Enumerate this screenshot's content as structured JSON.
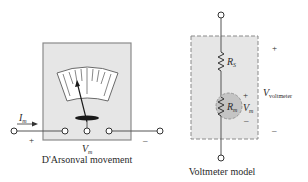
{
  "left_figure": {
    "caption": "D'Arsonval movement",
    "current_label": "I",
    "current_sub": "m",
    "voltage_label": "V",
    "voltage_sub": "m",
    "plus": "+",
    "minus": "–"
  },
  "right_figure": {
    "caption": "Voltmeter model",
    "series_resistor_label": "R",
    "series_resistor_sub": "S",
    "meter_resistor_label": "R",
    "meter_resistor_sub": "m",
    "meter_voltage_label": "V",
    "meter_voltage_sub": "m",
    "meter_plus": "+",
    "meter_minus": "–",
    "voltmeter_label": "V",
    "voltmeter_sub": "voltmeter",
    "outer_plus": "+",
    "outer_minus": "–"
  },
  "colors": {
    "box_fill": "#e6e6e6",
    "box_border": "#8a8a8a",
    "meter_circle": "#c4c4c4",
    "wire": "#555555",
    "needle": "#1a1a1a"
  }
}
